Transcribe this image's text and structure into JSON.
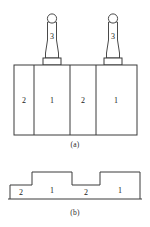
{
  "figure": {
    "captions": {
      "part_a": "(a)",
      "part_b": "(b)"
    },
    "part_a": {
      "name": "front-view-assembly",
      "block_labels": [
        "2",
        "1",
        "2",
        "1"
      ],
      "segments": [
        {
          "label": "2",
          "x": 14,
          "width": 20
        },
        {
          "label": "1",
          "x": 34,
          "width": 36
        },
        {
          "label": "2",
          "x": 70,
          "width": 26
        },
        {
          "label": "1",
          "x": 96,
          "width": 41
        }
      ],
      "block": {
        "x": 14,
        "y": 65,
        "width": 123,
        "height": 70
      },
      "tools": [
        {
          "label": "3",
          "center_x": 52,
          "base_x": 43,
          "base_y": 58,
          "base_width": 18,
          "base_height": 7
        },
        {
          "label": "3",
          "center_x": 113,
          "base_x": 104,
          "base_y": 58,
          "base_width": 18,
          "base_height": 7
        }
      ],
      "tool_label": "3"
    },
    "part_b": {
      "name": "stepped-profile-view",
      "step_labels": [
        "2",
        "1",
        "2",
        "1"
      ],
      "baseline_y": 199,
      "steps": [
        {
          "label": "2",
          "x": 10,
          "width": 22,
          "top_y": 185
        },
        {
          "label": "1",
          "x": 32,
          "width": 40,
          "top_y": 172
        },
        {
          "label": "2",
          "x": 72,
          "width": 28,
          "top_y": 185
        },
        {
          "label": "1",
          "x": 100,
          "width": 40,
          "top_y": 172
        }
      ]
    }
  },
  "colors": {
    "line": "#3a3a3a",
    "tool_line": "#4a4a4a",
    "text": "#1a1a1a",
    "caption": "#2b2b2b",
    "background": "#ffffff"
  }
}
